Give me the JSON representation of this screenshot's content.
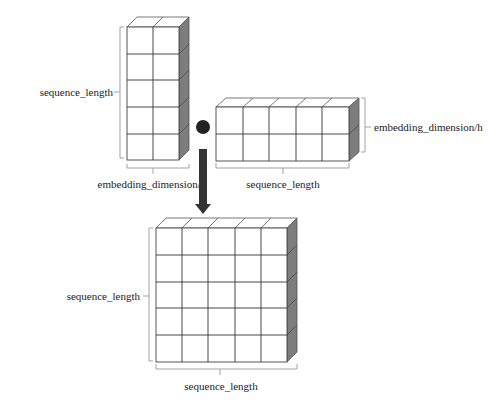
{
  "diagram": {
    "operator": "dot-product",
    "colors": {
      "cell_stroke": "#444444",
      "side_shade": "#7d7d7d",
      "operator_dot": "#222222",
      "arrow": "#333333",
      "brace": "#999999"
    },
    "matrices": [
      {
        "id": "query",
        "rows": 5,
        "cols": 2,
        "row_label": "sequence_length",
        "col_label": "embedding_dimension/h"
      },
      {
        "id": "key_transposed",
        "rows": 2,
        "cols": 5,
        "row_label": "embedding_dimension/h",
        "col_label": "sequence_length"
      },
      {
        "id": "result",
        "rows": 5,
        "cols": 5,
        "row_label": "sequence_length",
        "col_label": "sequence_length"
      }
    ]
  }
}
